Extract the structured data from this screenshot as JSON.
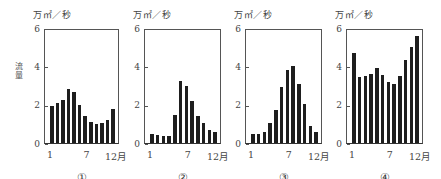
{
  "chart_data": [
    {
      "type": "bar",
      "label": "①",
      "title": "",
      "unit_label": "万㎡／秒",
      "ylabel": "流量",
      "xlabel": "月",
      "categories": [
        "1",
        "2",
        "3",
        "4",
        "5",
        "6",
        "7",
        "8",
        "9",
        "10",
        "11",
        "12"
      ],
      "values": [
        1.95,
        2.1,
        2.3,
        2.85,
        2.7,
        2.0,
        1.45,
        1.1,
        1.0,
        1.05,
        1.2,
        1.8
      ],
      "ylim": [
        0,
        6
      ],
      "yticks": [
        "0",
        "2",
        "4",
        "6"
      ],
      "xticks": [
        "1",
        "7",
        "12月"
      ],
      "grid": false
    },
    {
      "type": "bar",
      "label": "②",
      "unit_label": "万㎡／秒",
      "categories": [
        "1",
        "2",
        "3",
        "4",
        "5",
        "6",
        "7",
        "8",
        "9",
        "10",
        "11",
        "12"
      ],
      "values": [
        0.5,
        0.42,
        0.36,
        0.36,
        1.5,
        3.3,
        3.05,
        2.25,
        1.42,
        1.05,
        0.68,
        0.6
      ],
      "ylim": [
        0,
        6
      ],
      "yticks": [
        "0",
        "2",
        "4",
        "6"
      ],
      "xticks": [
        "1",
        "7",
        "12月"
      ],
      "grid": false
    },
    {
      "type": "bar",
      "label": "③",
      "unit_label": "万㎡／秒",
      "categories": [
        "1",
        "2",
        "3",
        "4",
        "5",
        "6",
        "7",
        "8",
        "9",
        "10",
        "11",
        "12"
      ],
      "values": [
        0.47,
        0.47,
        0.6,
        1.08,
        1.73,
        3.0,
        3.9,
        4.1,
        3.15,
        2.08,
        0.9,
        0.6
      ],
      "ylim": [
        0,
        6
      ],
      "yticks": [
        "0",
        "2",
        "4",
        "6"
      ],
      "xticks": [
        "1",
        "7",
        "12月"
      ],
      "grid": false
    },
    {
      "type": "bar",
      "label": "④",
      "unit_label": "万㎡／秒",
      "categories": [
        "1",
        "2",
        "3",
        "4",
        "5",
        "6",
        "7",
        "8",
        "9",
        "10",
        "11",
        "12"
      ],
      "values": [
        4.8,
        3.5,
        3.54,
        3.66,
        3.97,
        3.6,
        3.24,
        3.16,
        3.58,
        4.4,
        5.1,
        5.7
      ],
      "ylim": [
        0,
        6
      ],
      "yticks": [
        "0",
        "2",
        "4",
        "6"
      ],
      "xticks": [
        "1",
        "7",
        "12月"
      ],
      "grid": false
    }
  ],
  "labels": {
    "unit": "万㎡／秒",
    "ylabel": "流量",
    "x_first": "1",
    "x_mid": "7",
    "x_last": "12月",
    "y0": "0",
    "y2": "2",
    "y4": "4",
    "y6": "6",
    "panels": [
      "①",
      "②",
      "③",
      "④"
    ]
  }
}
